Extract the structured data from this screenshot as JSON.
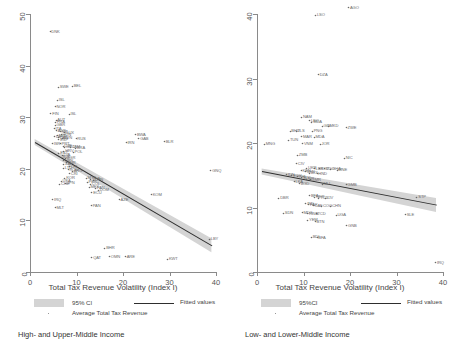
{
  "figure": {
    "panels": [
      {
        "id": "left",
        "subtitle": "High- and Upper-Middle Income",
        "xlabel": "Total Tax Revenue Volatility (Index I)",
        "xticks": [
          "0",
          "10",
          "20",
          "30",
          "40"
        ],
        "yticks": [
          "0",
          "10",
          "20",
          "30",
          "40",
          "50"
        ],
        "legend": {
          "ci": "95% CI",
          "avg": "Average Total Tax Revenue",
          "fit": "Fitted values"
        }
      },
      {
        "id": "right",
        "subtitle": "Low- and Lower-Middle Income",
        "xlabel": "Total Tax Revenue Volatility (Index I)",
        "xticks": [
          "0",
          "10",
          "20",
          "30",
          "40"
        ],
        "yticks": [
          "0",
          "10",
          "20",
          "30",
          "40"
        ],
        "legend": {
          "ci": "95%CI",
          "avg": "Average Total Tax Revenue",
          "fit": "Fitted values"
        }
      }
    ]
  },
  "colors": {
    "ci_band": "#d4d4d4",
    "fit_line": "#2e2e2e",
    "point": "#6a6a6a",
    "axis": "#8a8a8a",
    "text": "#555555"
  },
  "chart_data": [
    {
      "type": "scatter",
      "title": "High- and Upper-Middle Income",
      "xlabel": "Total Tax Revenue Volatility (Index I)",
      "ylabel": "Average Total Tax Revenue",
      "xlim": [
        0,
        40
      ],
      "ylim": [
        0,
        50
      ],
      "xticks": [
        0,
        10,
        20,
        30,
        40
      ],
      "yticks": [
        0,
        10,
        20,
        30,
        40,
        50
      ],
      "grid": false,
      "legend_position": "below",
      "legend": [
        "95% CI",
        "Average Total Tax Revenue",
        "Fitted values"
      ],
      "fit_line": {
        "x": [
          1.0,
          39.0
        ],
        "y": [
          25.2,
          5.2
        ]
      },
      "points": [
        {
          "label": "DNK",
          "x": 4.2,
          "y": 46.5
        },
        {
          "label": "SWE",
          "x": 6.0,
          "y": 35.8
        },
        {
          "label": "BEL",
          "x": 9.0,
          "y": 36.0
        },
        {
          "label": "ISL",
          "x": 5.8,
          "y": 33.3
        },
        {
          "label": "NOR",
          "x": 5.3,
          "y": 32.0
        },
        {
          "label": "FIN",
          "x": 4.4,
          "y": 30.7
        },
        {
          "label": "ISL",
          "x": 8.3,
          "y": 30.6
        },
        {
          "label": "AUT",
          "x": 5.5,
          "y": 29.4
        },
        {
          "label": "FRA",
          "x": 5.4,
          "y": 29.0
        },
        {
          "label": "GBR",
          "x": 5.3,
          "y": 28.4
        },
        {
          "label": "ITA",
          "x": 5.1,
          "y": 27.8
        },
        {
          "label": "AUS",
          "x": 5.6,
          "y": 27.4
        },
        {
          "label": "NZL",
          "x": 6.4,
          "y": 27.2
        },
        {
          "label": "LUX",
          "x": 7.4,
          "y": 27.0
        },
        {
          "label": "HUN",
          "x": 6.6,
          "y": 26.6
        },
        {
          "label": "NLD",
          "x": 5.8,
          "y": 26.4
        },
        {
          "label": "DEU",
          "x": 5.2,
          "y": 26.2
        },
        {
          "label": "CAN",
          "x": 6.0,
          "y": 26.0
        },
        {
          "label": "SVN",
          "x": 6.9,
          "y": 25.9
        },
        {
          "label": "ESP",
          "x": 6.1,
          "y": 25.6
        },
        {
          "label": "RUS",
          "x": 9.8,
          "y": 25.8
        },
        {
          "label": "BWA",
          "x": 22.6,
          "y": 26.6
        },
        {
          "label": "GAB",
          "x": 23.3,
          "y": 25.8
        },
        {
          "label": "BLR",
          "x": 28.8,
          "y": 25.2
        },
        {
          "label": "IRN",
          "x": 20.6,
          "y": 25.0
        },
        {
          "label": "ISR",
          "x": 4.7,
          "y": 24.9
        },
        {
          "label": "PRT",
          "x": 6.4,
          "y": 24.8
        },
        {
          "label": "CZE",
          "x": 7.0,
          "y": 24.4
        },
        {
          "label": "GRC",
          "x": 7.3,
          "y": 24.2
        },
        {
          "label": "JAM",
          "x": 8.7,
          "y": 24.2
        },
        {
          "label": "BRA",
          "x": 9.7,
          "y": 24.0
        },
        {
          "label": "HRV",
          "x": 7.2,
          "y": 23.4
        },
        {
          "label": "POL",
          "x": 9.2,
          "y": 23.2
        },
        {
          "label": "EST",
          "x": 6.1,
          "y": 23.0
        },
        {
          "label": "LVA",
          "x": 6.8,
          "y": 22.6
        },
        {
          "label": "SVK",
          "x": 6.6,
          "y": 22.2
        },
        {
          "label": "BGR",
          "x": 7.5,
          "y": 22.0
        },
        {
          "label": "URY",
          "x": 7.1,
          "y": 21.6
        },
        {
          "label": "TUR",
          "x": 7.7,
          "y": 21.2
        },
        {
          "label": "ZAF",
          "x": 7.2,
          "y": 20.9
        },
        {
          "label": "CHL",
          "x": 8.3,
          "y": 20.4
        },
        {
          "label": "LTU",
          "x": 7.1,
          "y": 20.1
        },
        {
          "label": "ROU",
          "x": 8.1,
          "y": 19.8
        },
        {
          "label": "ARG",
          "x": 9.0,
          "y": 19.5
        },
        {
          "label": "CRI",
          "x": 8.4,
          "y": 19.0
        },
        {
          "label": "KOR",
          "x": 7.4,
          "y": 18.2
        },
        {
          "label": "MYS",
          "x": 12.0,
          "y": 18.2
        },
        {
          "label": "THA",
          "x": 13.0,
          "y": 18.0
        },
        {
          "label": "CHN",
          "x": 13.5,
          "y": 17.8
        },
        {
          "label": "PER",
          "x": 12.2,
          "y": 17.4
        },
        {
          "label": "COL",
          "x": 12.9,
          "y": 17.0
        },
        {
          "label": "USA",
          "x": 6.6,
          "y": 17.6
        },
        {
          "label": "JPN",
          "x": 7.6,
          "y": 17.2
        },
        {
          "label": "CHE",
          "x": 6.3,
          "y": 17.0
        },
        {
          "label": "MEX",
          "x": 12.6,
          "y": 16.4
        },
        {
          "label": "PAN",
          "x": 14.0,
          "y": 16.2
        },
        {
          "label": "DOM",
          "x": 14.6,
          "y": 15.8
        },
        {
          "label": "ECU",
          "x": 13.2,
          "y": 15.4
        },
        {
          "label": "IRQ",
          "x": 4.8,
          "y": 14.0
        },
        {
          "label": "MLT",
          "x": 5.3,
          "y": 12.4
        },
        {
          "label": "PAN",
          "x": 13.1,
          "y": 12.8
        },
        {
          "label": "AZE",
          "x": 19.1,
          "y": 14.0
        },
        {
          "label": "KOM",
          "x": 26.0,
          "y": 15.0
        },
        {
          "label": "LBY",
          "x": 38.5,
          "y": 6.3
        },
        {
          "label": "GNQ",
          "x": 38.8,
          "y": 19.6
        },
        {
          "label": "BHR",
          "x": 16.0,
          "y": 4.6
        },
        {
          "label": "QAT",
          "x": 13.2,
          "y": 2.7
        },
        {
          "label": "OMN",
          "x": 17.0,
          "y": 2.9
        },
        {
          "label": "ARE",
          "x": 20.4,
          "y": 2.9
        },
        {
          "label": "KWT",
          "x": 29.5,
          "y": 2.5
        }
      ]
    },
    {
      "type": "scatter",
      "title": "Low- and Lower-Middle Income",
      "xlabel": "Total Tax Revenue Volatility (Index I)",
      "ylabel": "Average Total Tax Revenue",
      "xlim": [
        0,
        40
      ],
      "ylim": [
        0,
        40
      ],
      "xticks": [
        0,
        10,
        20,
        30,
        40
      ],
      "yticks": [
        0,
        10,
        20,
        30,
        40
      ],
      "grid": false,
      "legend_position": "below",
      "legend": [
        "95%CI",
        "Average Total Tax Revenue",
        "Fitted values"
      ],
      "fit_line": {
        "x": [
          1.0,
          38.5
        ],
        "y": [
          15.6,
          10.4
        ]
      },
      "points": [
        {
          "label": "AGO",
          "x": 19.6,
          "y": 41.0
        },
        {
          "label": "LSO",
          "x": 12.5,
          "y": 39.8
        },
        {
          "label": "DZA",
          "x": 13.1,
          "y": 30.6
        },
        {
          "label": "NAM",
          "x": 9.5,
          "y": 24.0
        },
        {
          "label": "LSO",
          "x": 11.2,
          "y": 23.4
        },
        {
          "label": "MDA",
          "x": 11.7,
          "y": 23.2
        },
        {
          "label": "GIN",
          "x": 13.9,
          "y": 22.6
        },
        {
          "label": "MKD",
          "x": 15.2,
          "y": 22.6
        },
        {
          "label": "ZWE",
          "x": 19.1,
          "y": 22.4
        },
        {
          "label": "BHU",
          "x": 7.0,
          "y": 21.8
        },
        {
          "label": "TLS",
          "x": 8.3,
          "y": 21.8
        },
        {
          "label": "PNG",
          "x": 11.8,
          "y": 21.8
        },
        {
          "label": "MAR",
          "x": 9.5,
          "y": 21.0
        },
        {
          "label": "MDA",
          "x": 12.2,
          "y": 20.9
        },
        {
          "label": "TUN",
          "x": 6.7,
          "y": 20.4
        },
        {
          "label": "VNM",
          "x": 9.7,
          "y": 19.9
        },
        {
          "label": "JOR",
          "x": 13.5,
          "y": 19.8
        },
        {
          "label": "MNG",
          "x": 1.5,
          "y": 19.8
        },
        {
          "label": "ZMB",
          "x": 8.6,
          "y": 18.1
        },
        {
          "label": "CIV",
          "x": 8.4,
          "y": 16.8
        },
        {
          "label": "NIC",
          "x": 18.7,
          "y": 17.6
        },
        {
          "label": "UKR",
          "x": 10.6,
          "y": 16.1
        },
        {
          "label": "LBR",
          "x": 12.2,
          "y": 16.0
        },
        {
          "label": "KGZ",
          "x": 13.4,
          "y": 16.0
        },
        {
          "label": "TGO",
          "x": 14.4,
          "y": 16.0
        },
        {
          "label": "GHA",
          "x": 15.8,
          "y": 15.9
        },
        {
          "label": "MNE",
          "x": 17.1,
          "y": 15.8
        },
        {
          "label": "KEN",
          "x": 9.4,
          "y": 15.7
        },
        {
          "label": "SEN",
          "x": 10.3,
          "y": 15.5
        },
        {
          "label": "BOL",
          "x": 11.2,
          "y": 15.3
        },
        {
          "label": "HND",
          "x": 12.8,
          "y": 15.2
        },
        {
          "label": "IDN",
          "x": 6.2,
          "y": 15.1
        },
        {
          "label": "EGY",
          "x": 7.4,
          "y": 14.9
        },
        {
          "label": "PHL",
          "x": 8.6,
          "y": 14.8
        },
        {
          "label": "SLV",
          "x": 9.5,
          "y": 14.6
        },
        {
          "label": "NPL",
          "x": 10.5,
          "y": 14.4
        },
        {
          "label": "CMR",
          "x": 11.4,
          "y": 14.3
        },
        {
          "label": "LKA",
          "x": 7.9,
          "y": 14.0
        },
        {
          "label": "BGD",
          "x": 9.0,
          "y": 13.7
        },
        {
          "label": "MLI",
          "x": 13.9,
          "y": 13.6
        },
        {
          "label": "GMB",
          "x": 19.1,
          "y": 13.5
        },
        {
          "label": "STP",
          "x": 34.3,
          "y": 11.6
        },
        {
          "label": "DBR",
          "x": 4.6,
          "y": 11.4
        },
        {
          "label": "BFA",
          "x": 11.2,
          "y": 11.8
        },
        {
          "label": "NER",
          "x": 12.3,
          "y": 11.6
        },
        {
          "label": "TCD",
          "x": 13.2,
          "y": 11.4
        },
        {
          "label": "CIV",
          "x": 14.6,
          "y": 11.4
        },
        {
          "label": "IND",
          "x": 10.4,
          "y": 10.6
        },
        {
          "label": "PAK",
          "x": 11.0,
          "y": 10.4
        },
        {
          "label": "CAF",
          "x": 12.0,
          "y": 10.3
        },
        {
          "label": "COG",
          "x": 13.8,
          "y": 10.2
        },
        {
          "label": "CHN",
          "x": 15.8,
          "y": 10.2
        },
        {
          "label": "SDN",
          "x": 5.6,
          "y": 9.1
        },
        {
          "label": "MDG",
          "x": 9.6,
          "y": 9.2
        },
        {
          "label": "RWA",
          "x": 10.8,
          "y": 9.0
        },
        {
          "label": "TCD",
          "x": 12.6,
          "y": 9.0
        },
        {
          "label": "UGA",
          "x": 16.9,
          "y": 8.8
        },
        {
          "label": "SLE",
          "x": 31.8,
          "y": 8.9
        },
        {
          "label": "YEM",
          "x": 10.8,
          "y": 8.0
        },
        {
          "label": "BTN",
          "x": 12.4,
          "y": 7.8
        },
        {
          "label": "GNB",
          "x": 19.2,
          "y": 7.2
        },
        {
          "label": "BDI",
          "x": 11.6,
          "y": 5.4
        },
        {
          "label": "BFA",
          "x": 12.8,
          "y": 5.3
        },
        {
          "label": "IRQ",
          "x": 38.3,
          "y": 1.4
        }
      ]
    }
  ]
}
